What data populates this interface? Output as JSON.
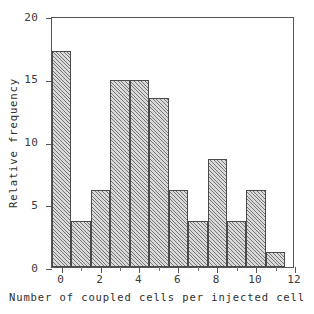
{
  "chart_data": {
    "type": "bar",
    "title": "",
    "subtitle": "",
    "xlabel": "Number of coupled cells per injected cell",
    "ylabel": "Relative frequency",
    "categories": [
      "0",
      "1",
      "2",
      "3",
      "4",
      "5",
      "6",
      "7",
      "8",
      "9",
      "10",
      "11"
    ],
    "values": [
      17.2,
      3.7,
      6.1,
      14.9,
      14.9,
      13.5,
      6.1,
      3.7,
      8.6,
      3.7,
      6.1,
      1.2
    ],
    "bin_width": 1,
    "xlim": [
      -0.5,
      12
    ],
    "ylim": [
      0,
      20
    ],
    "xticks": [
      0,
      2,
      4,
      6,
      8,
      10,
      12
    ],
    "xtick_labels": [
      "0",
      "2",
      "4",
      "6",
      "8",
      "10",
      "12"
    ],
    "xticks_minor": [
      1,
      3,
      5,
      7,
      9,
      11
    ],
    "yticks": [
      0,
      5,
      10,
      15,
      20
    ],
    "ytick_labels": [
      "0",
      "5",
      "10",
      "15",
      "20"
    ],
    "grid": false,
    "legend": null,
    "bar_style": {
      "fill": "#d9d9d9",
      "hatch": "diagonal-45",
      "edge_color": "#4a4a4a"
    },
    "axis_color": "#555555",
    "background": "#ffffff",
    "annotations": []
  }
}
